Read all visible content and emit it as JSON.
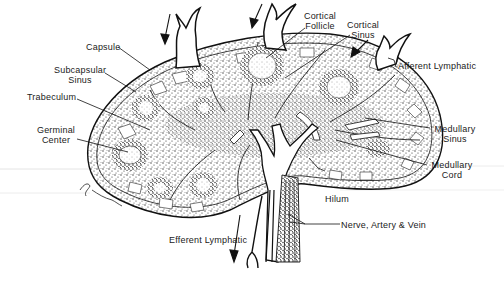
{
  "diagram": {
    "labels": {
      "capsule": "Capsule",
      "subcapsular_sinus_1": "Subcapsular",
      "subcapsular_sinus_2": "Sinus",
      "trabeculum": "Trabeculum",
      "germinal_center_1": "Germinal",
      "germinal_center_2": "Center",
      "cortical_follicle_1": "Cortical",
      "cortical_follicle_2": "Follicle",
      "cortical_sinus_1": "Cortical",
      "cortical_sinus_2": "Sinus",
      "afferent_lymphatic": "Afferent Lymphatic",
      "medullary_sinus_1": "Medullary",
      "medullary_sinus_2": "Sinus",
      "medullary_cord_1": "Medullary",
      "medullary_cord_2": "Cord",
      "hilum": "Hilum",
      "nerve_artery_vein": "Nerve, Artery & Vein",
      "efferent_lymphatic": "Efferent Lymphatic"
    },
    "signature": "G. Shumaker",
    "colors": {
      "ink": "#1a1a1a",
      "background": "#ffffff",
      "stipple": "#333333"
    }
  }
}
